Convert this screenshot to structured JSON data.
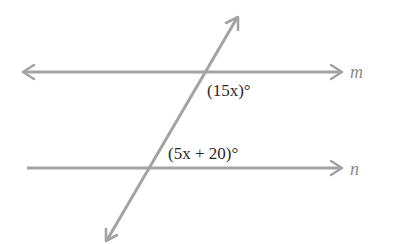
{
  "diagram": {
    "type": "parallel-lines-transversal",
    "line_color": "#a3a3a3",
    "text_color": "#2a2a2a",
    "lines": [
      {
        "name": "m",
        "label": "m",
        "y": 72,
        "x1": 22,
        "x2": 343,
        "left_arrow": true,
        "right_arrow": true
      },
      {
        "name": "n",
        "label": "n",
        "y": 168,
        "x1": 27,
        "x2": 343,
        "left_arrow": false,
        "right_arrow": true
      }
    ],
    "transversal": {
      "x1": 106,
      "y1": 242,
      "x2": 238,
      "y2": 16,
      "both_arrows": true
    },
    "angles": [
      {
        "id": "angle-m",
        "label": "(15x)°",
        "at_line": "m",
        "position": "below-right of intersection"
      },
      {
        "id": "angle-n",
        "label": "(5x + 20)°",
        "at_line": "n",
        "position": "above-right of intersection"
      }
    ]
  }
}
